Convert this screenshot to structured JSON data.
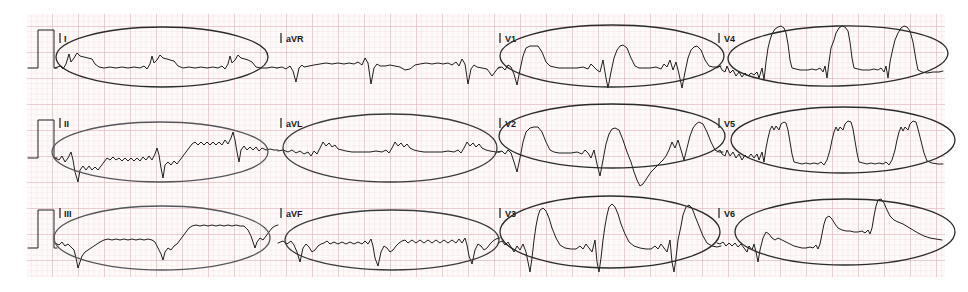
{
  "document": {
    "type": "12-lead-ecg-strip",
    "title": "12-Lead ECG with circled leads",
    "paper": {
      "background_color": "#ffffff",
      "grid_region": {
        "x": 27,
        "y": 14,
        "width": 918,
        "height": 263
      },
      "small_square_px": 5.2,
      "large_square_px": 26,
      "fine_grid_color": "#e9c9cc",
      "bold_grid_color": "#d8a8ad"
    },
    "trace": {
      "color": "#1f1f1f",
      "line_width": 1.0
    },
    "annotation": {
      "tool": "hand-drawn ellipse",
      "colors": [
        "#2b2b2b",
        "#55555a",
        "#3a3a3c"
      ],
      "line_width": 1.3,
      "note": "11 of 12 leads are circled; lead aVR is NOT circled"
    }
  },
  "rows": [
    {
      "index": 0,
      "y_baseline": 62,
      "cal_pulse": {
        "x": 40,
        "label": "calibration-pulse",
        "amplitude_mm": 10
      },
      "leads": [
        {
          "name": "I",
          "label": "I",
          "tick_x": 60,
          "label_x": 64,
          "label_y": 41,
          "circled": true,
          "ellipse": {
            "cx": 162,
            "cy": 57,
            "rx": 106,
            "ry": 30,
            "rot": 0,
            "color": "#2b2b2b"
          }
        },
        {
          "name": "aVR",
          "label": "aVR",
          "tick_x": 281,
          "label_x": 286,
          "label_y": 41,
          "circled": false,
          "ellipse": null
        },
        {
          "name": "V1",
          "label": "V1",
          "tick_x": 500,
          "label_x": 505,
          "label_y": 41,
          "circled": true,
          "ellipse": {
            "cx": 612,
            "cy": 56,
            "rx": 112,
            "ry": 31,
            "rot": 0,
            "color": "#2b2b2b"
          }
        },
        {
          "name": "V4",
          "label": "V4",
          "tick_x": 719,
          "label_x": 724,
          "label_y": 41,
          "circled": true,
          "ellipse": {
            "cx": 838,
            "cy": 56,
            "rx": 110,
            "ry": 30,
            "rot": -1.5,
            "color": "#2b2b2b"
          }
        }
      ]
    },
    {
      "index": 1,
      "y_baseline": 157,
      "cal_pulse": {
        "x": 40,
        "label": "calibration-pulse",
        "amplitude_mm": 10
      },
      "leads": [
        {
          "name": "II",
          "label": "II",
          "tick_x": 60,
          "label_x": 64,
          "label_y": 126,
          "circled": true,
          "ellipse": {
            "cx": 160,
            "cy": 152,
            "rx": 108,
            "ry": 30,
            "rot": 0,
            "color": "#55555a"
          }
        },
        {
          "name": "aVL",
          "label": "aVL",
          "tick_x": 281,
          "label_x": 286,
          "label_y": 126,
          "circled": true,
          "ellipse": {
            "cx": 390,
            "cy": 148,
            "rx": 107,
            "ry": 34,
            "rot": 0,
            "color": "#3a3a3c"
          }
        },
        {
          "name": "V2",
          "label": "V2",
          "tick_x": 500,
          "label_x": 505,
          "label_y": 126,
          "circled": true,
          "ellipse": {
            "cx": 612,
            "cy": 136,
            "rx": 113,
            "ry": 32,
            "rot": 0,
            "color": "#2b2b2b"
          }
        },
        {
          "name": "V5",
          "label": "V5",
          "tick_x": 719,
          "label_x": 724,
          "label_y": 126,
          "circled": true,
          "ellipse": {
            "cx": 843,
            "cy": 140,
            "rx": 112,
            "ry": 33,
            "rot": 0,
            "color": "#2b2b2b"
          }
        }
      ]
    },
    {
      "index": 2,
      "y_baseline": 248,
      "cal_pulse": {
        "x": 40,
        "label": "calibration-pulse",
        "amplitude_mm": 10
      },
      "leads": [
        {
          "name": "III",
          "label": "III",
          "tick_x": 60,
          "label_x": 64,
          "label_y": 216,
          "circled": true,
          "ellipse": {
            "cx": 162,
            "cy": 238,
            "rx": 108,
            "ry": 32,
            "rot": 0,
            "color": "#55555a"
          }
        },
        {
          "name": "aVF",
          "label": "aVF",
          "tick_x": 281,
          "label_x": 286,
          "label_y": 216,
          "circled": true,
          "ellipse": {
            "cx": 392,
            "cy": 240,
            "rx": 107,
            "ry": 30,
            "rot": 0,
            "color": "#3a3a3c"
          }
        },
        {
          "name": "V3",
          "label": "V3",
          "tick_x": 500,
          "label_x": 505,
          "label_y": 216,
          "circled": true,
          "ellipse": {
            "cx": 610,
            "cy": 232,
            "rx": 110,
            "ry": 36,
            "rot": 0,
            "color": "#2b2b2b"
          }
        },
        {
          "name": "V6",
          "label": "V6",
          "tick_x": 719,
          "label_x": 724,
          "label_y": 216,
          "circled": true,
          "ellipse": {
            "cx": 845,
            "cy": 232,
            "rx": 110,
            "ry": 33,
            "rot": 0,
            "color": "#2b2b2b"
          }
        }
      ]
    }
  ],
  "waveforms": {
    "note": "Each string is an SVG path 'd' attribute in page pixel coordinates tracing the printed ECG signal.",
    "row0_I": "M55,68 L60,66 L63,69 L66,64 L69,54 L71,62 L74,58 L77,53 L80,56 L84,57 L88,58 L92,59 L95,64 L99,67 L104,68 L110,67 L116,68 L122,67 L128,68 L134,67 L140,68 L144,66 L147,69 L150,64 L152,56 L154,63 L157,60 L160,55 L163,58 L167,59 L170,60 L174,61 L178,66 L183,68 L189,67 L195,68 L201,67 L207,68 L213,67 L218,68 L222,66 L225,69 L228,64 L230,56 L232,63 L235,60 L238,55 L241,58 L245,59 L248,60 L252,62 L256,67 L261,68 L267,68 L272,67 L277,68",
    "row0_aVR": "M277,68 L282,67 L286,69 L290,66 L293,71 L296,82 L299,68 L302,65 L304,67 L309,66 L314,65 L320,64 L326,63 L332,64 L338,63 L344,64 L349,63 L354,64 L358,62 L362,65 L365,58 L368,63 L371,84 L374,68 L377,64 L380,66 L385,66 L390,65 L395,66 L400,67 L405,70 L410,69 L415,65 L420,64 L426,63 L432,64 L438,63 L443,64 L448,63 L452,65 L456,62 L459,66 L462,59 L465,64 L468,84 L471,69 L474,65 L477,67 L482,68 L487,69 L490,73 L492,76 L495,72 L498,68 L500,67",
    "row0_V1": "M498,68 L502,67 L505,70 L508,65 L511,67 L514,74 L517,85 L520,70 L523,56 L526,48 L530,46 L534,46 L538,46 L542,52 L546,62 L550,66 L554,67 L559,68 L565,68 L571,68 L577,68 L583,67 L588,69 L591,64 L594,67 L597,70 L600,72 L603,60 L606,78 L608,88 L611,72 L614,58 L617,50 L620,46 L623,45 L627,48 L631,58 L635,66 L639,68 L644,68 L650,68 L656,67 L661,69 L664,64 L667,67 L670,60 L673,70 L676,62 L679,74 L682,88 L685,72 L688,58 L691,50 L694,47 L697,46 L701,50 L705,60 L709,66 L713,67 L717,67 L721,66",
    "row0_V4": "M717,68 L720,66 L722,70 L725,72 L727,66 L730,73 L733,70 L736,76 L739,72 L742,77 L745,73 L748,76 L751,73 L754,75 L757,72 L759,78 L762,68 L764,80 L766,62 L768,48 L770,40 L772,34 L775,29 L778,27 L781,26 L784,28 L786,33 L788,44 L790,60 L792,68 L796,69 L800,70 L804,70 L808,70 L812,69 L816,70 L820,68 L823,72 L825,66 L827,78 L829,62 L831,48 L834,40 L836,33 L839,28 L842,26 L845,27 L848,31 L850,42 L852,58 L854,68 L858,69 L862,70 L866,70 L870,70 L874,69 L878,70 L881,68 L884,72 L886,66 L888,78 L890,62 L893,48 L895,40 L898,33 L901,28 L904,26 L907,27 L910,31 L913,42 L916,60 L918,70 L922,72 L927,73 L933,72 L939,72 L943,71",
    "row1_II": "M55,158 L59,160 L62,156 L65,162 L68,158 L71,152 L73,160 L75,172 L78,182 L80,170 L83,166 L86,170 L89,166 L92,170 L95,167 L98,170 L101,166 L104,162 L107,158 L110,160 L113,157 L116,160 L119,158 L122,161 L125,158 L128,161 L131,158 L134,161 L137,158 L140,161 L143,157 L146,160 L149,156 L152,160 L155,154 L157,148 L159,155 L161,168 L163,178 L165,165 L168,162 L171,165 L174,161 L177,164 L180,160 L183,156 L186,152 L189,148 L192,144 L195,142 L198,145 L201,142 L204,145 L207,142 L210,145 L213,142 L216,145 L219,142 L222,145 L225,140 L228,144 L231,138 L233,132 L235,140 L237,152 L239,162 L241,150 L244,146 L247,150 L250,147 L253,150 L256,147 L259,151 L262,148 L266,150 L270,149 L274,150 L278,150",
    "row1_aVL": "M278,151 L283,150 L288,152 L292,150 L296,153 L300,151 L304,154 L308,152 L311,156 L314,151 L317,154 L320,148 L323,142 L326,146 L329,143 L332,147 L335,145 L338,149 L342,150 L346,151 L352,152 L358,152 L364,152 L370,152 L376,151 L382,152 L386,150 L389,153 L392,148 L395,142 L398,146 L401,143 L404,147 L407,144 L410,148 L414,150 L418,151 L424,152 L430,152 L436,152 L442,152 L448,151 L454,152 L458,150 L461,153 L464,148 L467,142 L470,146 L473,143 L476,147 L479,144 L482,148 L486,150 L490,151 L496,152 L500,152",
    "row1_V2": "M498,152 L502,151 L505,154 L508,150 L511,153 L514,162 L517,172 L520,158 L523,142 L526,132 L530,128 L534,127 L538,127 L542,132 L546,142 L550,150 L554,152 L559,153 L565,153 L571,153 L577,152 L582,154 L585,150 L588,153 L591,158 L594,150 L597,164 L600,176 L603,160 L606,144 L609,134 L612,129 L615,128 L619,130 L623,140 L627,152 L631,162 L634,172 L637,180 L640,186 L643,184 L647,178 L651,172 L655,168 L659,164 L663,160 L666,156 L669,150 L672,142 L675,148 L678,140 L681,150 L684,160 L687,148 L690,136 L693,128 L696,124 L699,122 L703,124 L707,132 L711,142 L715,150 L719,152 L723,152",
    "row1_V5": "M717,152 L720,150 L722,154 L725,156 L727,150 L730,156 L733,152 L736,158 L739,154 L742,160 L745,155 L748,158 L751,154 L754,158 L757,154 L759,160 L762,152 L764,162 L766,148 L768,138 L770,130 L772,126 L774,130 L776,126 L779,130 L781,124 L784,122 L786,123 L788,130 L790,142 L792,154 L794,162 L798,163 L802,164 L806,163 L810,164 L814,163 L818,164 L821,162 L824,165 L827,160 L830,150 L832,140 L834,132 L836,127 L838,131 L840,127 L843,130 L845,124 L848,121 L851,122 L853,129 L855,141 L857,153 L859,162 L863,163 L867,164 L871,163 L875,164 L879,163 L883,164 L886,162 L889,165 L892,160 L895,150 L897,140 L899,132 L901,127 L903,131 L905,127 L908,130 L910,124 L913,121 L916,122 L918,129 L921,141 L924,153 L927,161 L932,163 L938,164 L943,164",
    "row2_III": "M55,243 L59,245 L62,242 L65,246 L68,244 L71,247 L74,250 L76,258 L78,268 L80,262 L82,256 L85,252 L88,250 L91,248 L94,246 L97,244 L100,242 L104,240 L108,239 L112,240 L116,239 L120,240 L124,239 L128,240 L132,239 L136,240 L140,239 L144,240 L148,239 L152,240 L155,242 L158,248 L161,254 L163,260 L165,252 L168,248 L171,250 L174,246 L177,244 L180,240 L183,236 L186,232 L189,228 L192,226 L196,225 L200,226 L204,225 L208,226 L212,225 L216,226 L220,225 L224,226 L228,225 L232,226 L236,225 L240,226 L244,226 L248,230 L251,236 L253,242 L255,248 L257,242 L260,238 L263,240 L266,236 L269,232 L272,228 L275,226 L278,225",
    "row2_aVF": "M278,243 L283,241 L287,244 L291,241 L294,245 L297,252 L300,262 L303,248 L306,244 L309,247 L312,252 L315,250 L318,246 L321,244 L324,243 L327,241 L330,244 L334,242 L338,244 L342,242 L346,244 L350,242 L354,244 L358,242 L362,244 L365,241 L368,244 L371,239 L373,246 L375,258 L378,266 L381,252 L384,246 L387,248 L390,252 L393,250 L396,246 L399,243 L402,241 L405,240 L408,243 L412,240 L416,243 L420,240 L424,243 L428,240 L432,243 L436,240 L440,243 L444,240 L448,243 L452,240 L456,243 L459,239 L462,243 L465,238 L467,245 L469,256 L472,264 L475,250 L478,244 L481,246 L484,250 L487,248 L490,244 L493,241 L496,239 L500,238",
    "row2_V3": "M498,243 L502,241 L505,245 L508,242 L511,247 L514,252 L517,246 L520,250 L523,244 L526,252 L528,262 L530,272 L532,258 L534,240 L536,226 L538,216 L540,210 L543,208 L546,211 L549,218 L552,228 L556,238 L560,245 L565,248 L571,249 L576,249 L580,246 L583,249 L586,244 L589,248 L592,252 L595,240 L597,262 L599,272 L601,258 L603,240 L605,226 L607,215 L609,207 L612,204 L615,207 L618,214 L621,224 L625,234 L629,242 L634,246 L640,248 L646,249 L651,249 L655,246 L658,249 L661,244 L664,248 L667,252 L670,240 L672,262 L674,272 L676,258 L678,240 L681,226 L683,215 L686,207 L689,205 L692,208 L695,216 L699,226 L703,236 L707,243 L712,246 L717,247 L721,246",
    "row2_V6": "M717,243 L720,244 L723,242 L726,246 L729,243 L732,246 L735,243 L738,247 L741,244 L744,248 L747,252 L749,246 L752,250 L754,244 L756,252 L758,262 L760,250 L763,238 L766,232 L769,234 L772,238 L775,240 L778,238 L782,240 L786,242 L790,244 L794,246 L798,247 L802,248 L806,248 L810,247 L813,248 L816,245 L818,249 L820,244 L822,234 L824,224 L826,218 L829,216 L832,219 L835,224 L838,228 L842,230 L846,231 L850,231 L854,232 L858,232 L862,231 L865,233 L868,230 L870,234 L872,228 L874,216 L876,206 L878,200 L881,199 L884,203 L887,210 L890,216 L894,220 L898,222 L903,224 L908,227 L913,230 L918,233 L924,236 L930,238 L936,239 L942,240"
  },
  "legend": {
    "uncircled_lead": "aVR",
    "circled_leads": [
      "I",
      "II",
      "III",
      "aVL",
      "aVF",
      "V1",
      "V2",
      "V3",
      "V4",
      "V5",
      "V6"
    ]
  }
}
